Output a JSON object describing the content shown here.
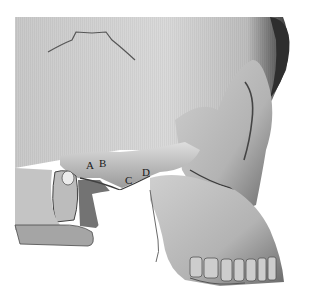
{
  "figure": {
    "colors": {
      "background": "#ffffff",
      "bone_light": "#d6d6d6",
      "bone_mid": "#a8a8a8",
      "bone_dark": "#4a4a4a",
      "label_text": "#1a1a1a"
    },
    "landmarks": [
      {
        "id": "A",
        "label": "A",
        "x": 86,
        "y": 160
      },
      {
        "id": "B",
        "label": "B",
        "x": 99,
        "y": 158
      },
      {
        "id": "C",
        "label": "C",
        "x": 125,
        "y": 175
      },
      {
        "id": "D",
        "label": "D",
        "x": 142,
        "y": 167
      }
    ]
  }
}
